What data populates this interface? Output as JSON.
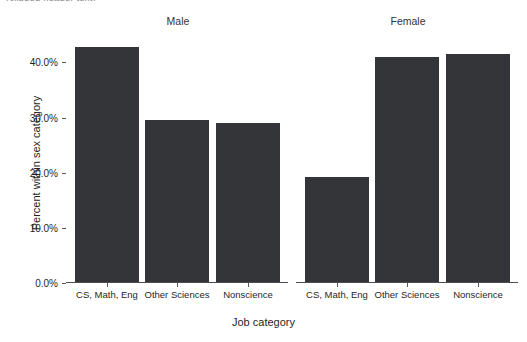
{
  "top_caption": "(clipped header text)",
  "axes": {
    "y_title": "Percent within sex category",
    "x_title": "Job category",
    "y_ticks": [
      "0.0%",
      "10.0%",
      "20.0%",
      "30.0%",
      "40.0%"
    ]
  },
  "facets": [
    {
      "label": "Male"
    },
    {
      "label": "Female"
    }
  ],
  "categories": [
    "CS, Math, Eng",
    "Other Sciences",
    "Nonscience"
  ],
  "colors": {
    "bar_fill": "#333538",
    "axis_line": "#4d4d4d",
    "text": "#1f1f1f",
    "background": "#ffffff"
  },
  "chart_data": {
    "type": "bar",
    "title": "",
    "subtitle": "",
    "xlabel": "Job category",
    "ylabel": "Percent within sex category",
    "ylim": [
      0,
      44
    ],
    "yticks": [
      0,
      10,
      20,
      30,
      40
    ],
    "ytick_labels": [
      "0.0%",
      "10.0%",
      "20.0%",
      "30.0%",
      "40.0%"
    ],
    "grid": false,
    "legend": "none",
    "facet_by": "sex",
    "facets": [
      "Male",
      "Female"
    ],
    "categories": [
      "CS, Math, Eng",
      "Other Sciences",
      "Nonscience"
    ],
    "series": [
      {
        "name": "Male",
        "values": [
          42.6,
          29.4,
          28.8
        ]
      },
      {
        "name": "Female",
        "values": [
          19.0,
          40.7,
          41.2
        ]
      }
    ],
    "bar_color": "#333538"
  }
}
